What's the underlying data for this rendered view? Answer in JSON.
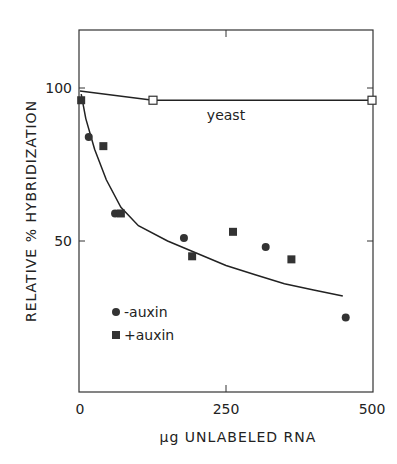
{
  "chart_data": {
    "type": "scatter",
    "title": "",
    "xlabel": "μg UNLABELED RNA",
    "ylabel": "RELATIVE % HYBRIDIZATION",
    "xlim": [
      0,
      510
    ],
    "ylim": [
      0,
      120
    ],
    "x_ticks": [
      0,
      250,
      500
    ],
    "x_tick_labels": [
      "0",
      "250",
      "500"
    ],
    "y_ticks": [
      50,
      100
    ],
    "y_tick_labels": [
      "50",
      "100"
    ],
    "grid": false,
    "legend_position": "lower-left inside",
    "series": [
      {
        "name": "-auxin",
        "marker": "filled-circle",
        "points": [
          [
            15,
            84
          ],
          [
            60,
            59
          ],
          [
            178,
            51
          ],
          [
            318,
            48
          ],
          [
            455,
            25
          ]
        ]
      },
      {
        "name": "+auxin",
        "marker": "filled-square",
        "points": [
          [
            2,
            96
          ],
          [
            40,
            81
          ],
          [
            70,
            59
          ],
          [
            192,
            45
          ],
          [
            262,
            53
          ],
          [
            362,
            44
          ]
        ]
      },
      {
        "name": "yeast",
        "marker": "open-square",
        "points": [
          [
            125,
            96
          ],
          [
            500,
            96
          ]
        ]
      }
    ],
    "curves": [
      {
        "name": "yeast-fit",
        "points": [
          [
            0,
            99
          ],
          [
            125,
            96
          ],
          [
            250,
            96
          ],
          [
            500,
            96
          ]
        ]
      },
      {
        "name": "auxin-fit",
        "points": [
          [
            2,
            98
          ],
          [
            10,
            90
          ],
          [
            25,
            80
          ],
          [
            45,
            70
          ],
          [
            70,
            61
          ],
          [
            100,
            55
          ],
          [
            150,
            50
          ],
          [
            200,
            46
          ],
          [
            250,
            42
          ],
          [
            300,
            39
          ],
          [
            350,
            36
          ],
          [
            400,
            34
          ],
          [
            450,
            32
          ]
        ]
      }
    ],
    "annotations": [
      {
        "text": "yeast",
        "x": 250,
        "y": 91
      }
    ]
  }
}
